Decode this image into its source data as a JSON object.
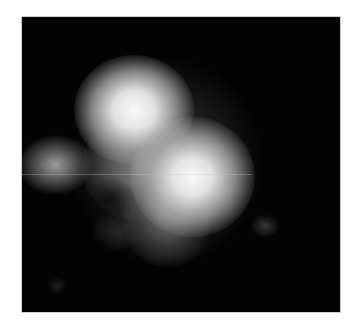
{
  "image": {
    "description": "Grayscale fluorescence-like microscopy image of bright blob clusters on black background",
    "background": "#030303",
    "frame": "#ffffff"
  }
}
